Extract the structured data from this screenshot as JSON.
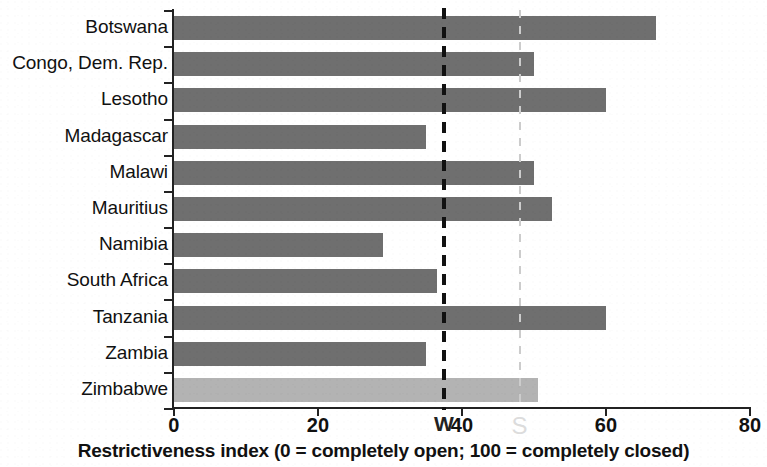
{
  "chart_data": {
    "type": "bar",
    "orientation": "horizontal",
    "title": "",
    "subtitle": "",
    "xlabel": "Restrictiveness index (0 = completely open; 100 = completely closed)",
    "ylabel": "",
    "xlim": [
      0,
      80
    ],
    "xticks": [
      0,
      20,
      40,
      60,
      80
    ],
    "xtick_labels": [
      "0",
      "20",
      "40",
      "60",
      "80"
    ],
    "grid": false,
    "legend": null,
    "categories": [
      "Botswana",
      "Congo, Dem. Rep.",
      "Lesotho",
      "Madagascar",
      "Malawi",
      "Mauritius",
      "Namibia",
      "South Africa",
      "Tanzania",
      "Zambia",
      "Zimbabwe"
    ],
    "values": [
      67,
      50,
      60,
      35,
      50,
      52.5,
      29,
      36.5,
      60,
      35,
      50.5
    ],
    "bar_colors": [
      "#6f6f6f",
      "#6f6f6f",
      "#6f6f6f",
      "#6f6f6f",
      "#6f6f6f",
      "#6f6f6f",
      "#6f6f6f",
      "#6f6f6f",
      "#6f6f6f",
      "#6f6f6f",
      "#b3b3b3"
    ],
    "highlighted_category": "Zimbabwe",
    "reference_lines": [
      {
        "name": "average-reference-line",
        "value": 37.5,
        "label": "W",
        "style": "dashed",
        "color": "#111111"
      },
      {
        "name": "secondary-reference-line",
        "value": 48,
        "label": "S",
        "style": "dashed",
        "color": "#cccccc"
      }
    ],
    "annotations": [
      {
        "name": "reference-marker-w",
        "text": "W",
        "x": 37.5
      },
      {
        "name": "watermark-s",
        "text": "S",
        "x": 48
      }
    ]
  },
  "axis": {
    "caption": "Restrictiveness index (0 = completely open; 100 = completely closed)"
  }
}
